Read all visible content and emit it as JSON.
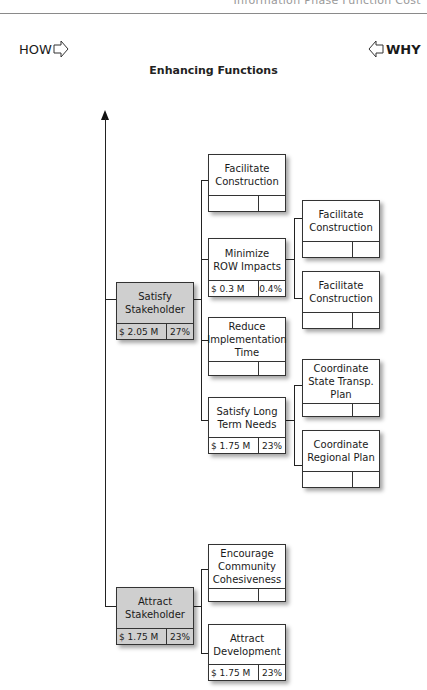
{
  "header": {
    "partial_title": "Information Phase  Function  Cost"
  },
  "direction": {
    "how_label": "HOW",
    "why_label": "WHY"
  },
  "subtitle": "Enhancing Functions",
  "nodes": {
    "satisfy_stakeholder": {
      "title": "Satisfy Stakeholder",
      "cost": "$ 2.05 M",
      "pct": "27%"
    },
    "attract_stakeholder": {
      "title": "Attract Stakeholder",
      "cost": "$ 1.75 M",
      "pct": "23%"
    },
    "facilitate_construction_1": {
      "title": "Facilitate Construction",
      "cost": "",
      "pct": ""
    },
    "minimize_row": {
      "title": "Minimize ROW Impacts",
      "cost": "$ 0.3 M",
      "pct": "0.4%"
    },
    "reduce_time": {
      "title": "Reduce Implementation Time",
      "cost": "",
      "pct": ""
    },
    "satisfy_long_term": {
      "title": "Satisfy Long Term Needs",
      "cost": "$ 1.75 M",
      "pct": "23%"
    },
    "facilitate_construction_2": {
      "title": "Facilitate Construction",
      "cost": "",
      "pct": ""
    },
    "facilitate_construction_3": {
      "title": "Facilitate Construction",
      "cost": "",
      "pct": ""
    },
    "coordinate_state": {
      "title": "Coordinate State Transp. Plan",
      "cost": "",
      "pct": ""
    },
    "coordinate_regional": {
      "title": "Coordinate Regional Plan",
      "cost": "",
      "pct": ""
    },
    "encourage_community": {
      "title": "Encourage Community Cohesiveness",
      "cost": "",
      "pct": ""
    },
    "attract_development": {
      "title": "Attract Development",
      "cost": "$ 1.75 M",
      "pct": "23%"
    }
  }
}
